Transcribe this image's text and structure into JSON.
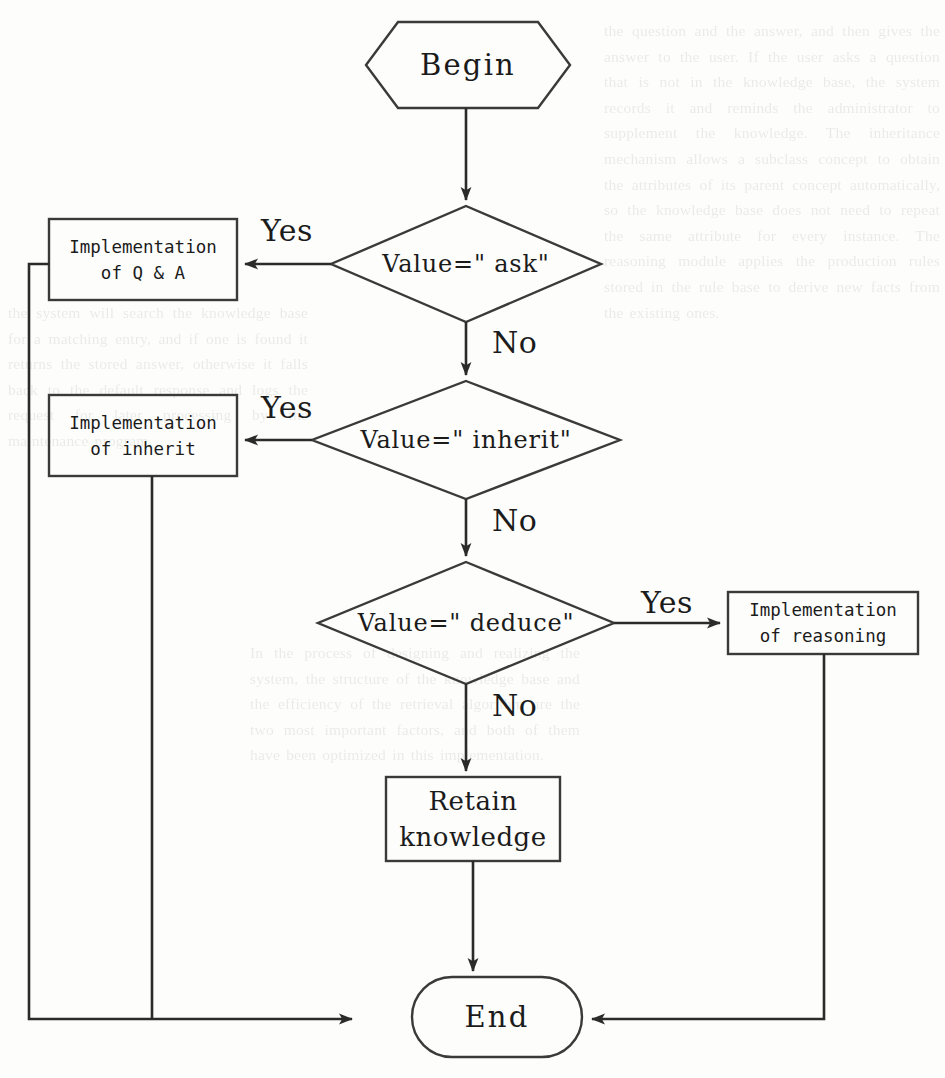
{
  "diagram": {
    "type": "flowchart",
    "nodes": [
      {
        "id": "begin",
        "shape": "hexagon",
        "label": "Begin"
      },
      {
        "id": "d_ask",
        "shape": "diamond",
        "label": "Value=\" ask\""
      },
      {
        "id": "qa",
        "shape": "rectangle",
        "line1": "Implementation",
        "line2": "of Q & A"
      },
      {
        "id": "d_inh",
        "shape": "diamond",
        "label": "Value=\" inherit\""
      },
      {
        "id": "inherit",
        "shape": "rectangle",
        "line1": "Implementation",
        "line2": "of inherit"
      },
      {
        "id": "d_ded",
        "shape": "diamond",
        "label": "Value=\" deduce\""
      },
      {
        "id": "reason",
        "shape": "rectangle",
        "line1": "Implementation",
        "line2": "of reasoning"
      },
      {
        "id": "retain",
        "shape": "rectangle",
        "line1": "Retain",
        "line2": "knowledge"
      },
      {
        "id": "end",
        "shape": "stadium",
        "label": "End"
      }
    ],
    "edges": [
      {
        "from": "begin",
        "to": "d_ask",
        "label": ""
      },
      {
        "from": "d_ask",
        "to": "qa",
        "label": "Yes"
      },
      {
        "from": "d_ask",
        "to": "d_inh",
        "label": "No"
      },
      {
        "from": "d_inh",
        "to": "inherit",
        "label": "Yes"
      },
      {
        "from": "d_inh",
        "to": "d_ded",
        "label": "No"
      },
      {
        "from": "d_ded",
        "to": "reason",
        "label": "Yes"
      },
      {
        "from": "d_ded",
        "to": "retain",
        "label": "No"
      },
      {
        "from": "retain",
        "to": "end",
        "label": ""
      },
      {
        "from": "qa",
        "to": "end",
        "label": ""
      },
      {
        "from": "inherit",
        "to": "end",
        "label": ""
      },
      {
        "from": "reason",
        "to": "end",
        "label": ""
      }
    ],
    "edge_labels": {
      "yes_ask": "Yes",
      "no_ask": "No",
      "yes_inherit": "Yes",
      "no_inherit": "No",
      "yes_deduce": "Yes",
      "no_deduce": "No"
    },
    "colors": {
      "stroke": "#3a3a38",
      "background": "#fdfdfc",
      "text": "#1b1b1b"
    }
  },
  "bleed_text": {
    "right": "the question and the answer, and then gives the answer to the user. If the user asks a question that is not in the knowledge base, the system records it and reminds the administrator to supplement the knowledge. The inheritance mechanism allows a subclass concept to obtain the attributes of its parent concept automatically, so the knowledge base does not need to repeat the same attribute for every instance. The reasoning module applies the production rules stored in the rule base to derive new facts from the existing ones.",
    "left": "the system will search the knowledge base for a matching entry, and if one is found it returns the stored answer, otherwise it falls back to the default response and logs the request for later processing by the maintenance program.",
    "mid": "In the process of designing and realizing the system, the structure of the knowledge base and the efficiency of the retrieval algorithm are the two most important factors, and both of them have been optimized in this implementation."
  }
}
